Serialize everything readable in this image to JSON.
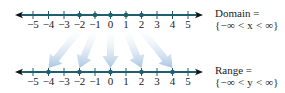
{
  "diagram": {
    "colors": {
      "axis": "#1f5e6e",
      "axis_arrow": "#111111",
      "dot": "#1f5e6e",
      "mapping_arrow": "#b9d0e6",
      "text": "#222222"
    },
    "tick_values": [
      -5,
      -4,
      -3,
      -2,
      -1,
      0,
      1,
      2,
      3,
      4,
      5
    ],
    "tick_labels": [
      "−5",
      "−4",
      "−3",
      "−2",
      "−1",
      "0",
      "1",
      "2",
      "3",
      "4",
      "5"
    ],
    "domain_line": {
      "label_title": "Domain =",
      "label_expr": "{−∞ < x < ∞}",
      "highlighted_points": [
        -2,
        -1,
        0,
        1,
        2
      ]
    },
    "range_line": {
      "label_title": "Range =",
      "label_expr": "{−∞ < y < ∞}",
      "highlighted_points": [
        -4,
        -2,
        0,
        2,
        4
      ]
    },
    "mappings": [
      {
        "from": -2,
        "to": -4
      },
      {
        "from": -1,
        "to": -2
      },
      {
        "from": 0,
        "to": 0
      },
      {
        "from": 1,
        "to": 2
      },
      {
        "from": 2,
        "to": 4
      }
    ]
  }
}
